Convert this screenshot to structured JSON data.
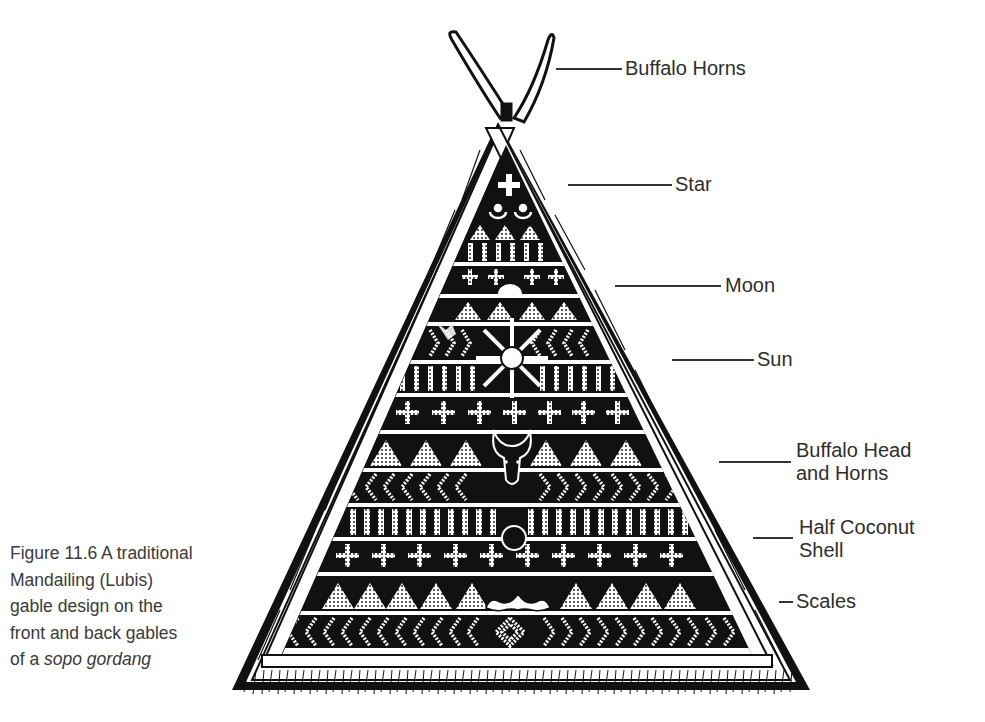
{
  "caption": {
    "line1": "Figure 11.6  A traditional",
    "line2": "Mandailing (Lubis)",
    "line3": "gable design on the",
    "line4": "front and back gables",
    "line5_prefix": "of a ",
    "line5_italic": "sopo gordang"
  },
  "labels": {
    "buffalo_horns": "Buffalo Horns",
    "star": "Star",
    "moon": "Moon",
    "sun": "Sun",
    "buffalo_head_line1": "Buffalo Head",
    "buffalo_head_line2": "and Horns",
    "half_coconut_line1": "Half Coconut",
    "half_coconut_line2": "Shell",
    "scales": "Scales"
  },
  "colors": {
    "ink": "#111111",
    "paper": "#ffffff",
    "text": "#2e2e2e"
  }
}
